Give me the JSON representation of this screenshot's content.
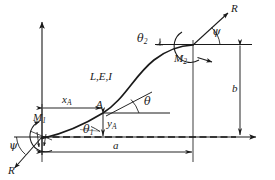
{
  "figure": {
    "kind": "engineering-beam-elastica-diagram",
    "axes": {
      "y_label": "Y",
      "x_label": "X"
    },
    "labels": {
      "material_props": "L,E,I",
      "point_a": "A",
      "theta": "θ",
      "theta_1": "θ",
      "theta_1_sub": "1",
      "theta_2": "θ",
      "theta_2_sub": "2",
      "psi_left": "ψ",
      "psi_right": "ψ",
      "force_left": "R",
      "force_right": "R",
      "moment_1": "M",
      "moment_1_sub": "1",
      "moment_2": "M",
      "moment_2_sub": "2",
      "x_a": "x",
      "x_a_sub": "A",
      "y_a": "y",
      "y_a_sub": "A",
      "dim_a": "a",
      "dim_b": "b"
    },
    "colors": {
      "stroke": "#1a1a1a",
      "background": "#ffffff"
    },
    "geometry": {
      "origin": [
        42,
        137
      ],
      "point_a": [
        103,
        113
      ],
      "end_point": [
        193,
        45
      ],
      "span_a": [
        42,
        193
      ],
      "height_b": [
        45,
        136
      ]
    }
  }
}
